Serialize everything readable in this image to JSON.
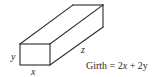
{
  "diagram": {
    "type": "oblique-rectangular-box",
    "labels": {
      "height": "y",
      "width": "x",
      "length": "z"
    },
    "formula": {
      "lhs": "Girth",
      "eq": " = ",
      "term1_coef": "2",
      "term1_var": "x",
      "plus": " + ",
      "term2_coef": "2",
      "term2_var": "y",
      "full_text": "Girth = 2x + 2y"
    },
    "colors": {
      "stroke": "#2a2a2a",
      "background": "#ffffff"
    }
  }
}
